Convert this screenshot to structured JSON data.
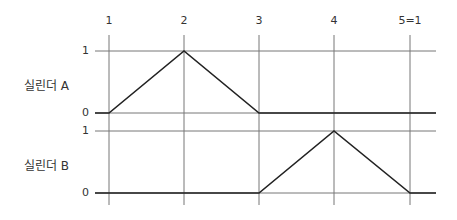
{
  "diagram": {
    "step_labels": [
      "1",
      "2",
      "3",
      "4",
      "5=1"
    ],
    "cylinders": [
      {
        "label": "실린더 A",
        "high_label": "1",
        "low_label": "0",
        "values": [
          0,
          1,
          0,
          0,
          0
        ]
      },
      {
        "label": "실린더 B",
        "high_label": "1",
        "low_label": "0",
        "values": [
          0,
          0,
          0,
          1,
          0
        ]
      }
    ],
    "colors": {
      "grid": "#777777",
      "signal": "#222222",
      "text": "#333333"
    }
  }
}
